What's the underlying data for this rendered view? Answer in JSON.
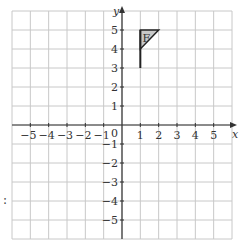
{
  "diagram": {
    "type": "coordinate-grid",
    "x_axis": {
      "label": "x",
      "ticks": [
        "-5",
        "-4",
        "-3",
        "-2",
        "-1",
        "1",
        "2",
        "3",
        "4",
        "5"
      ],
      "range": [
        -6,
        6
      ]
    },
    "y_axis": {
      "label": "y",
      "ticks": [
        "5",
        "4",
        "3",
        "2",
        "1",
        "-1",
        "-2",
        "-3",
        "-4",
        "-5"
      ],
      "range": [
        -6,
        6
      ]
    },
    "origin_label": "0",
    "shape": {
      "label": "F",
      "stem": [
        [
          1,
          3
        ],
        [
          1,
          5
        ]
      ],
      "flag_triangle": [
        [
          1,
          5
        ],
        [
          2,
          5
        ],
        [
          1,
          4
        ]
      ],
      "fill": "#c8c8c8"
    },
    "side_text": ":"
  },
  "colors": {
    "grid": "#c8c8c8",
    "axis": "#333333"
  }
}
